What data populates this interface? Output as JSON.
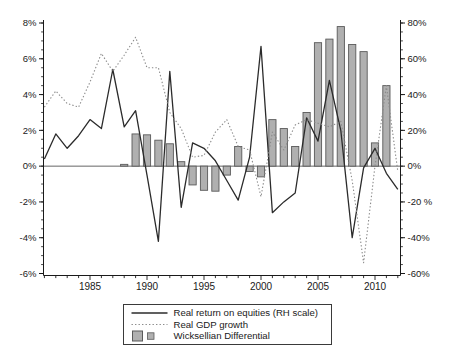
{
  "figure": {
    "width": 450,
    "height": 361,
    "background": "#ffffff"
  },
  "chart_data": {
    "type": "combo",
    "title": "",
    "grid": false,
    "years": [
      1981,
      1982,
      1983,
      1984,
      1985,
      1986,
      1987,
      1988,
      1989,
      1990,
      1991,
      1992,
      1993,
      1994,
      1995,
      1996,
      1997,
      1998,
      1999,
      2000,
      2001,
      2002,
      2003,
      2004,
      2005,
      2006,
      2007,
      2008,
      2009,
      2010,
      2011,
      2012
    ],
    "series": [
      {
        "name": "Real return on equities (RH scale)",
        "type": "line",
        "style": "solid",
        "axis": "right",
        "color": "#2b2b2b",
        "values": [
          4,
          18,
          10,
          17,
          26,
          21,
          54,
          22,
          31,
          -5,
          -42,
          53,
          -23,
          13,
          10,
          3,
          -8,
          -19,
          5,
          67,
          -26,
          -20,
          -15,
          27,
          14,
          48,
          20,
          -40,
          -1,
          10,
          -4,
          -13
        ]
      },
      {
        "name": "Real GDP growth",
        "type": "line",
        "style": "dotted",
        "axis": "left",
        "color": "#8b8b8b",
        "values": [
          3.3,
          4.2,
          3.5,
          3.3,
          4.7,
          6.3,
          5.3,
          6.2,
          7.2,
          5.5,
          5.5,
          3.0,
          2.1,
          0.5,
          0.6,
          1.9,
          2.6,
          1.1,
          0.9,
          -1.7,
          1.9,
          0.9,
          2.3,
          2.6,
          2.4,
          2.2,
          2.5,
          -0.8,
          -5.4,
          0.0,
          4.5,
          -0.3
        ]
      },
      {
        "name": "Wicksellian Differential",
        "type": "bar",
        "axis": "left",
        "fill": "#b0b0b0",
        "stroke": "#5a5a5a",
        "values": [
          null,
          null,
          null,
          null,
          null,
          null,
          null,
          0.1,
          1.8,
          1.75,
          1.45,
          1.25,
          0.25,
          -1.05,
          -1.35,
          -1.4,
          -0.5,
          1.1,
          -0.3,
          -0.6,
          2.6,
          2.1,
          1.1,
          3.0,
          6.9,
          7.1,
          7.8,
          6.8,
          6.4,
          1.3,
          4.5,
          null
        ]
      }
    ],
    "left_axis": {
      "min": -6,
      "max": 8,
      "tick_values": [
        8,
        6,
        4,
        2,
        0,
        -2,
        -4,
        -6
      ],
      "tick_labels": [
        "8%",
        "6%",
        "4%",
        "2%",
        "0%",
        "-2%",
        "-4%",
        "-6%"
      ],
      "minor_step": 0.5
    },
    "right_axis": {
      "min": -60,
      "max": 80,
      "tick_values": [
        80,
        60,
        40,
        20,
        0,
        -20,
        -40,
        -60
      ],
      "tick_labels": [
        "80%",
        "60%",
        "40%",
        "20%",
        "0%",
        "-20 %",
        "-40%",
        "-60%"
      ],
      "minor_step": 5
    },
    "x_axis": {
      "min": 1981,
      "max": 2012,
      "label_values": [
        1985,
        1990,
        1995,
        2000,
        2005,
        2010
      ],
      "labels": [
        "1985",
        "1990",
        "1995",
        "2000",
        "2005",
        "2010"
      ]
    },
    "zero_line": true,
    "legend_position": "bottom-center"
  },
  "legend": {
    "items": [
      {
        "symbol": "solid-line",
        "label": "Real return on equities (RH scale)"
      },
      {
        "symbol": "dotted-line",
        "label": "Real GDP growth"
      },
      {
        "symbol": "gray-squares",
        "label": "Wicksellian Differential"
      }
    ]
  },
  "colors": {
    "axis": "#1a1a1a",
    "zero_line": "#555555",
    "equities_line": "#2b2b2b",
    "gdp_line": "#8b8b8b",
    "bar_fill": "#b0b0b0",
    "bar_stroke": "#5a5a5a",
    "legend_border": "#3a3a3a",
    "text": "#1a1a1a"
  }
}
